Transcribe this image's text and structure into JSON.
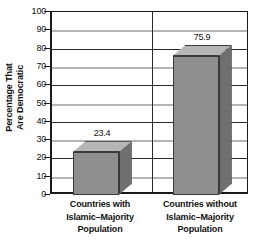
{
  "chart_data": {
    "type": "bar",
    "title": "",
    "xlabel": "",
    "ylabel": "Percentage That Are Democratic",
    "ylabel_lines": [
      "Percentage That",
      "Are Democratic"
    ],
    "categories": [
      "Countries with Islamic–Majority Population",
      "Countries without Islamic–Majority Population"
    ],
    "category_lines": [
      [
        "Countries with",
        "Islamic–Majority",
        "Population"
      ],
      [
        "Countries without",
        "Islamic–Majority",
        "Population"
      ]
    ],
    "values": [
      23.4,
      75.9
    ],
    "value_labels": [
      "23.4",
      "75.9"
    ],
    "ylim": [
      0,
      100
    ],
    "ytick_step": 10,
    "yticks": [
      100,
      90,
      80,
      70,
      60,
      50,
      40,
      30,
      20,
      10,
      0
    ],
    "ytick_labels": [
      "100",
      "90",
      "80",
      "70",
      "60",
      "50",
      "40",
      "30",
      "20",
      "10",
      "0"
    ],
    "grid": true,
    "grid_style": "horizontal alternating dark and light lines",
    "legend": null,
    "legend_position": "none",
    "style": "3d-bar",
    "colors": {
      "bar_front": "#8e8e8e",
      "bar_top": "#b6b6b6",
      "bar_side": "#6f6f6f",
      "bar_edge": "#3a3a3a",
      "gridline_major": "#2b2b2b",
      "gridline_minor": "#b5b5b5",
      "axis": "#1a1a1a",
      "background": "#ffffff",
      "text": "#111111"
    }
  }
}
